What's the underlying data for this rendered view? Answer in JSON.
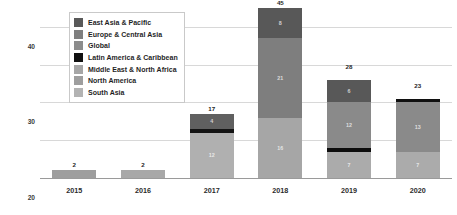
{
  "chart_data": {
    "type": "bar",
    "subtype": "stacked-bar",
    "title": "",
    "xlabel": "",
    "ylabel": "Number of New AI Ethics Principles",
    "categories": [
      "2015",
      "2016",
      "2017",
      "2018",
      "2019",
      "2020"
    ],
    "ylim": [
      0,
      45
    ],
    "yticks": [
      0,
      10,
      20,
      30,
      40
    ],
    "ytick_labels": [
      "0",
      "10",
      "20",
      "30",
      "40"
    ],
    "grid": true,
    "legend_position": "top-left-inside",
    "totals": [
      2,
      2,
      17,
      45,
      28,
      23
    ],
    "series": [
      {
        "name": "East Asia & Pacific",
        "color": "#595959",
        "values": [
          0,
          0,
          4,
          8,
          6,
          0
        ]
      },
      {
        "name": "Europe & Central Asia",
        "color": "#7f7f7f",
        "values": [
          0,
          0,
          0,
          21,
          12,
          13
        ]
      },
      {
        "name": "Global",
        "color": "#8c8c8c",
        "values": [
          0,
          0,
          0,
          0,
          0,
          0
        ]
      },
      {
        "name": "Latin America & Caribbean",
        "color": "#111111",
        "values": [
          0,
          0,
          1,
          0,
          1,
          1
        ]
      },
      {
        "name": "Middle East & North Africa",
        "color": "#a6a6a6",
        "values": [
          0,
          0,
          0,
          0,
          0,
          0
        ]
      },
      {
        "name": "North America",
        "color": "#9e9e9e",
        "values": [
          2,
          2,
          0,
          16,
          0,
          0
        ]
      },
      {
        "name": "South Asia",
        "color": "#b3b3b3",
        "values": [
          0,
          0,
          12,
          0,
          9,
          9
        ]
      }
    ],
    "bars": [
      {
        "category": "2015",
        "total": 2,
        "total_label": "2",
        "segments": [
          {
            "series": "North America",
            "value": 2,
            "label": "",
            "color": "#9e9e9e"
          }
        ]
      },
      {
        "category": "2016",
        "total": 2,
        "total_label": "2",
        "segments": [
          {
            "series": "South Asia",
            "value": 2,
            "label": "",
            "color": "#a8a8a8"
          }
        ]
      },
      {
        "category": "2017",
        "total": 17,
        "total_label": "17",
        "segments": [
          {
            "series": "South Asia",
            "value": 12,
            "label": "12",
            "color": "#b0b0b0"
          },
          {
            "series": "Latin America & Caribbean",
            "value": 1,
            "label": "",
            "color": "#141414"
          },
          {
            "series": "East Asia & Pacific",
            "value": 4,
            "label": "4",
            "color": "#606060"
          }
        ]
      },
      {
        "category": "2018",
        "total": 45,
        "total_label": "45",
        "segments": [
          {
            "series": "North America",
            "value": 16,
            "label": "16",
            "color": "#a6a6a6"
          },
          {
            "series": "Europe & Central Asia",
            "value": 21,
            "label": "21",
            "color": "#7e7e7e"
          },
          {
            "series": "East Asia & Pacific",
            "value": 8,
            "label": "8",
            "color": "#585858"
          }
        ]
      },
      {
        "category": "2019",
        "total": 28,
        "total_label": "28",
        "segments": [
          {
            "series": "South Asia",
            "value": 7,
            "label": "7",
            "color": "#ababab"
          },
          {
            "series": "Latin America & Caribbean",
            "value": 1,
            "label": "",
            "color": "#0d0d0d"
          },
          {
            "series": "Europe & Central Asia",
            "value": 12,
            "label": "12",
            "color": "#8a8a8a"
          },
          {
            "series": "East Asia & Pacific",
            "value": 6,
            "label": "6",
            "color": "#585858"
          }
        ]
      },
      {
        "category": "2020",
        "total": 23,
        "total_label": "23",
        "segments": [
          {
            "series": "South Asia",
            "value": 7,
            "label": "7",
            "color": "#ababab"
          },
          {
            "series": "Europe & Central Asia",
            "value": 13,
            "label": "13",
            "color": "#8a8a8a"
          },
          {
            "series": "Latin America & Caribbean",
            "value": 1,
            "label": "",
            "color": "#101010"
          }
        ]
      }
    ],
    "legend": [
      {
        "label": "East Asia & Pacific",
        "color": "#595959"
      },
      {
        "label": "Europe & Central Asia",
        "color": "#7f7f7f"
      },
      {
        "label": "Global",
        "color": "#8c8c8c"
      },
      {
        "label": "Latin America & Caribbean",
        "color": "#111111"
      },
      {
        "label": "Middle East & North Africa",
        "color": "#a6a6a6"
      },
      {
        "label": "North America",
        "color": "#9e9e9e"
      },
      {
        "label": "South Asia",
        "color": "#b3b3b3"
      }
    ]
  }
}
